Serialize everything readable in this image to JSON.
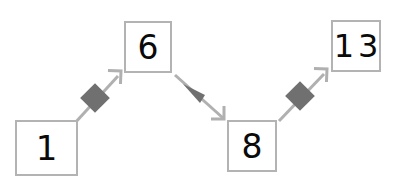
{
  "diagram": {
    "type": "flow-chain",
    "background_color": "#ffffff",
    "line_color": "#b0b0b0",
    "marker_color": "#707070",
    "box_border_color": "#b3b3b3",
    "box_fill_color": "#ffffff",
    "label_color": "#0a0a0a",
    "nodes": [
      {
        "id": "node-1",
        "label": "1",
        "name": "node-box-1"
      },
      {
        "id": "node-6",
        "label": "6",
        "name": "node-box-6"
      },
      {
        "id": "node-8",
        "label": "8",
        "name": "node-box-8"
      },
      {
        "id": "node-13",
        "label": "13",
        "name": "node-box-13"
      }
    ],
    "connectors": [
      {
        "id": "edge-1-6",
        "from": "1",
        "to": "6",
        "direction": "up-right",
        "midpoint_marker": "diamond",
        "arrowhead": "open"
      },
      {
        "id": "edge-6-8",
        "from": "6",
        "to": "8",
        "direction": "down-right",
        "midpoint_marker": "triangle-back",
        "arrowhead": "open"
      },
      {
        "id": "edge-8-13",
        "from": "8",
        "to": "13",
        "direction": "up-right",
        "midpoint_marker": "diamond",
        "arrowhead": "open"
      }
    ]
  }
}
